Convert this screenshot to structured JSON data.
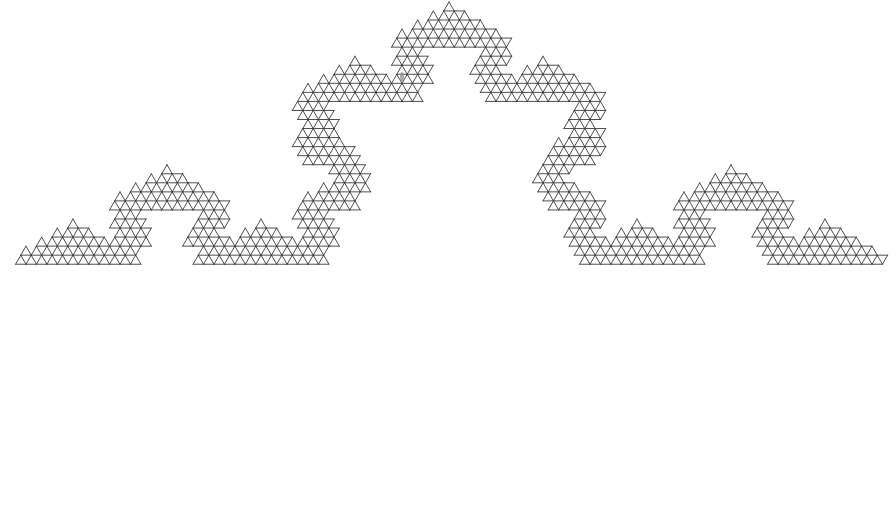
{
  "figure": {
    "background_color": "#ffffff",
    "stroke_color": "#3a3a3a",
    "stroke_width": 0.9,
    "canvas": {
      "width": 896,
      "height": 509
    }
  },
  "chart_data": {
    "type": "line",
    "xlabel": "",
    "ylabel": "",
    "grid": false,
    "legend": null,
    "xlim": [
      0,
      896
    ],
    "ylim": [
      0,
      509
    ],
    "lattice": {
      "triangle_edge": 17.4,
      "row_height": 15.07,
      "band_rows": 2,
      "orientation": "equilateral-triangular"
    },
    "curve": {
      "name": "koch-snowflake-segment",
      "iterations": 4,
      "turn_angle_degrees": 60,
      "axiom": "F",
      "rule": "F -> F+F--F+F",
      "start_point": [
        32,
        478
      ],
      "end_point": [
        872,
        24
      ],
      "segment_length": 17.4,
      "total_segments": 64,
      "direction_sequence": [
        0,
        60,
        -60,
        0,
        60,
        120,
        0,
        60,
        -60,
        0,
        -120,
        -60,
        0,
        60,
        -60,
        0,
        60,
        120,
        0,
        60,
        120,
        180,
        60,
        120,
        0,
        60,
        -60,
        0,
        60,
        120,
        0,
        60,
        -60,
        0,
        -120,
        -60,
        0,
        60,
        -60,
        0,
        -120,
        -60,
        -180,
        -120,
        -60,
        0,
        -120,
        -60,
        0,
        60,
        -60,
        0,
        60,
        120,
        0,
        60,
        -60,
        0,
        -120,
        -60,
        0,
        60,
        -60,
        0
      ]
    },
    "artifacts": [
      {
        "name": "dust-speck",
        "x": 400,
        "y": 72,
        "width": 4,
        "height": 9,
        "color": "#8d8d8d"
      }
    ]
  }
}
